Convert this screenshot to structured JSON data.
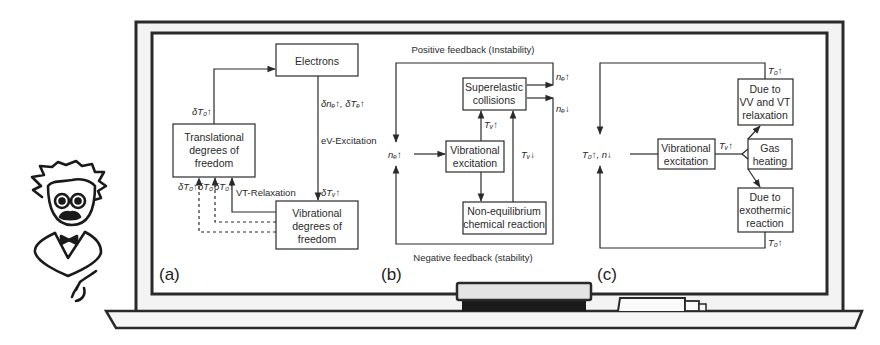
{
  "scene": {
    "description": "Cartoon professor next to a chalkboard showing three plasma feedback diagrams",
    "colors": {
      "ink": "#2a2a2a",
      "board": "#ffffff",
      "frame": "#f2f2f2",
      "eraser_top": "#e4e4e4",
      "eraser_base": "#1a1a1a"
    }
  },
  "panels": {
    "a": {
      "letter": "(a)",
      "boxes": {
        "electrons": "Electrons",
        "translational": [
          "Translational",
          "degrees of",
          "freedom"
        ],
        "vibrational": [
          "Vibrational",
          "degrees of",
          "freedom"
        ]
      },
      "labels": {
        "dT0_up": "δT₀↑",
        "dne_dTe": "δnₑ↑, δTₑ↑",
        "ev_excitation": "eV-Excitation",
        "dTv_up": "δTᵥ↑",
        "vt_relaxation": "VT-Relaxation",
        "dT0_a": "δT₀↑",
        "dT0_b": "δT₀",
        "dT0_c": "δT₀↑"
      }
    },
    "b": {
      "letter": "(b)",
      "title_top": "Positive feedback (Instability)",
      "title_bottom": "Negative feedback (stability)",
      "boxes": {
        "superelastic": [
          "Superelastic",
          "collisions"
        ],
        "vibrational": [
          "Vibrational",
          "excitation"
        ],
        "non_equilibrium": [
          "Non-equilibrium",
          "chemical reaction"
        ]
      },
      "labels": {
        "ne_up_right": "nₑ↑",
        "ne_down_right": "nₑ↓",
        "ne_up_left": "nₑ↑",
        "tv_up": "Tᵥ↑",
        "tv_down": "Tᵥ↓"
      }
    },
    "c": {
      "letter": "(c)",
      "boxes": {
        "vibrational": [
          "Vibrational",
          "excitation"
        ],
        "gas_heating": [
          "Gas",
          "heating"
        ],
        "vv_vt": [
          "Due to",
          "VV and VT",
          "relaxation"
        ],
        "exothermic": [
          "Due to",
          "exothermic",
          "reaction"
        ]
      },
      "labels": {
        "center": "T₀↑, n↓",
        "tv_up": "Tᵥ↑",
        "t0_up_top": "T₀↑",
        "t0_up_bottom": "T₀↑"
      }
    }
  }
}
